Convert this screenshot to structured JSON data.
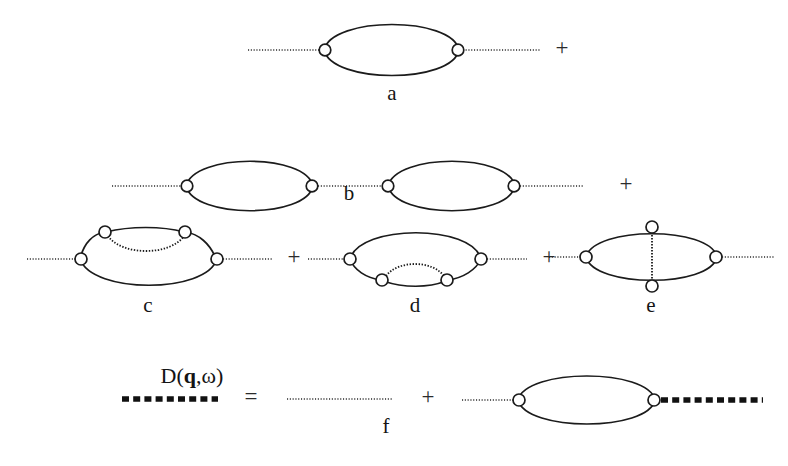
{
  "figure": {
    "background_color": "#ffffff",
    "ink_color": "#1b1b1b",
    "width": 788,
    "height": 466
  },
  "symbols": {
    "plus": "+",
    "equals": "="
  },
  "labels": {
    "a": "a",
    "b": "b",
    "c": "c",
    "d": "d",
    "e": "e",
    "f": "f"
  },
  "propagator": {
    "name_prefix": "D(",
    "momentum": "q",
    "comma": ",",
    "frequency": "ω",
    "name_suffix": ")",
    "full_text": "D(q,ω)"
  },
  "rows": [
    {
      "id": "row-a",
      "label": "a",
      "loops": 1,
      "operators": [
        "+"
      ],
      "description": "single bubble loop with two vertices and dotted external legs"
    },
    {
      "id": "row-b",
      "label": "b",
      "loops": 2,
      "operators": [
        "+"
      ],
      "description": "two bubble loops in series joined by a dotted line"
    },
    {
      "id": "row-cde",
      "labels": [
        "c",
        "d",
        "e"
      ],
      "operators": [
        "+",
        "+"
      ],
      "description": "three vertex-corrected bubbles: upper internal dotted arc, lower internal dotted arc, vertical internal dotted rung"
    },
    {
      "id": "row-f",
      "label": "f",
      "operators": [
        "=",
        "+"
      ],
      "description": "Dyson equation: dressed propagator equals bare dotted line plus bubble with dressed propagator"
    }
  ],
  "line_styles": {
    "bare_propagator": "thin dotted line",
    "dressed_propagator": "thick dashed line",
    "particle_loop": "solid curve",
    "interaction": "fine dotted line"
  },
  "vertices": {
    "shape": "open circle",
    "fill": "#ffffff",
    "stroke": "#1b1b1b",
    "radius": 5.6
  }
}
